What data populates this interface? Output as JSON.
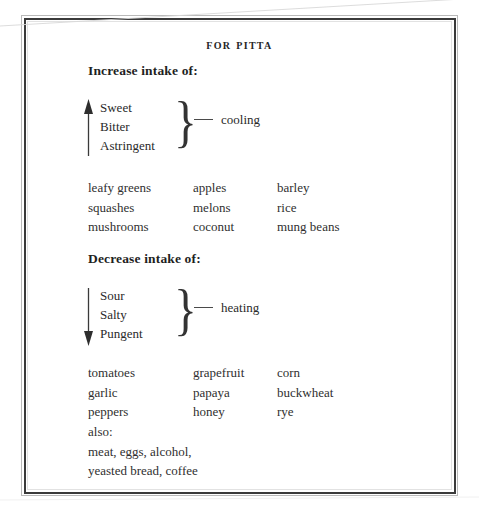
{
  "document": {
    "title": "FOR PITTA"
  },
  "sections": [
    {
      "id": "increase",
      "heading": "Increase intake of:",
      "arrow_direction": "up",
      "arrow_icon": "arrow-up-icon",
      "brace_glyph": "}",
      "effect": "cooling",
      "tastes": [
        "Sweet",
        "Bitter",
        "Astringent"
      ],
      "food_columns": [
        [
          "leafy greens",
          "squashes",
          "mushrooms"
        ],
        [
          "apples",
          "melons",
          "coconut"
        ],
        [
          "barley",
          "rice",
          "mung beans"
        ]
      ],
      "extras": []
    },
    {
      "id": "decrease",
      "heading": "Decrease intake of:",
      "arrow_direction": "down",
      "arrow_icon": "arrow-down-icon",
      "brace_glyph": "}",
      "effect": "heating",
      "tastes": [
        "Sour",
        "Salty",
        "Pungent"
      ],
      "food_columns": [
        [
          "tomatoes",
          "garlic",
          "peppers"
        ],
        [
          "grapefruit",
          "papaya",
          "honey"
        ],
        [
          "corn",
          "buckwheat",
          "rye"
        ]
      ],
      "extras": [
        "also:",
        "meat, eggs, alcohol,",
        "yeasted bread, coffee"
      ]
    }
  ],
  "colors": {
    "page_background": "#ffffff",
    "frame_dark": "#3a3a3a",
    "frame_light": "#b9b9b9",
    "text": "#2b2b2b"
  }
}
